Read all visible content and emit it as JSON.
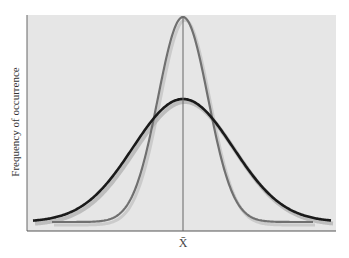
{
  "chart_data": {
    "type": "line",
    "title": "",
    "xlabel": "X̄",
    "ylabel": "Frequency of occurrence",
    "grid": false,
    "legend": null,
    "x_center_marker": "X̄",
    "series": [
      {
        "name": "narrow distribution (small standard deviation)",
        "color": "#707070",
        "shape": "normal",
        "mean": 0,
        "relative_sd": 0.5,
        "relative_peak": 1.0
      },
      {
        "name": "wide distribution (large standard deviation)",
        "color": "#1a1a1a",
        "shape": "normal",
        "mean": 0,
        "relative_sd": 1.0,
        "relative_peak": 0.6
      }
    ],
    "annotations": [
      "vertical line at mean X̄"
    ]
  },
  "colors": {
    "plot_background": "#e6e6e6",
    "axis": "#555555",
    "narrow_curve": "#707070",
    "wide_curve": "#1a1a1a",
    "mean_line": "#666666"
  },
  "labels": {
    "y_axis": "Frequency of occurrence",
    "x_axis": "X̄"
  }
}
